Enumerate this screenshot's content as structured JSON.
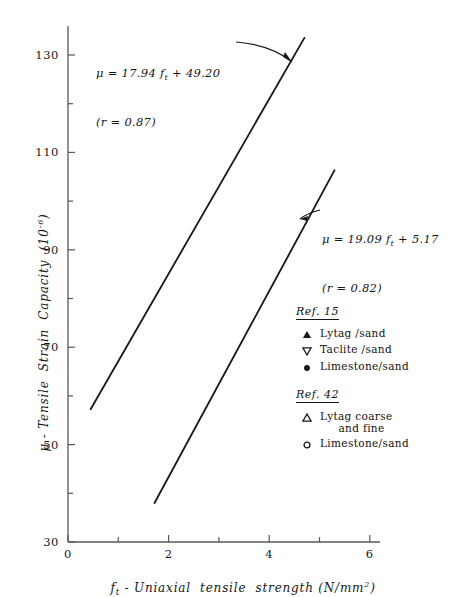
{
  "chart_data": {
    "type": "scatter",
    "title": "",
    "xlabel": "f_t - Uniaxial tensile strength (N/mm^2)",
    "ylabel": "mu - Tensile Strain Capacity (10^-6)",
    "xlim": [
      0,
      6.6
    ],
    "ylim": [
      30,
      136
    ],
    "xticks": [
      0,
      2,
      4,
      6
    ],
    "xticks_minor": [
      1,
      3,
      5
    ],
    "yticks": [
      30,
      50,
      70,
      90,
      110,
      130
    ],
    "yticks_minor": [
      40,
      60,
      80,
      100,
      120
    ],
    "grid": false,
    "legend_position": "right-lower",
    "series": [
      {
        "name": "Lytag/sand",
        "ref": "Ref. 15",
        "marker": "filled-triangle-up",
        "points": [
          [
            3.2,
            114.5
          ],
          [
            3.28,
            116.0
          ],
          [
            3.34,
            115.0
          ],
          [
            3.4,
            113.0
          ],
          [
            3.45,
            112.0
          ],
          [
            3.5,
            110.5
          ],
          [
            3.32,
            108.5
          ],
          [
            3.2,
            104.0
          ],
          [
            3.27,
            103.0
          ],
          [
            3.38,
            102.5
          ],
          [
            3.47,
            101.5
          ],
          [
            3.12,
            99.0
          ],
          [
            3.05,
            96.0
          ],
          [
            2.22,
            84.0
          ],
          [
            2.35,
            84.5
          ]
        ]
      },
      {
        "name": "Taclite/sand",
        "ref": "Ref. 15",
        "marker": "open-triangle-down",
        "points": [
          [
            3.02,
            115.0
          ],
          [
            3.55,
            110.5
          ],
          [
            3.62,
            107.5
          ],
          [
            3.7,
            105.5
          ],
          [
            3.5,
            103.0
          ],
          [
            3.78,
            102.0
          ],
          [
            3.18,
            98.5
          ],
          [
            3.25,
            95.5
          ],
          [
            3.3,
            92.0
          ],
          [
            2.72,
            87.0
          ],
          [
            3.02,
            85.5
          ],
          [
            2.58,
            100.0
          ],
          [
            2.6,
            96.0
          ]
        ]
      },
      {
        "name": "Limestone/sand",
        "ref": "Ref. 15",
        "marker": "filled-circle",
        "points": [
          [
            4.05,
            97.5
          ],
          [
            4.32,
            96.5
          ],
          [
            3.72,
            93.5
          ],
          [
            3.88,
            92.0
          ],
          [
            3.6,
            88.5
          ],
          [
            3.72,
            88.5
          ],
          [
            4.02,
            85.5
          ],
          [
            3.42,
            84.0
          ],
          [
            3.72,
            82.5
          ],
          [
            3.88,
            78.0
          ],
          [
            3.42,
            72.0
          ],
          [
            4.45,
            95.5
          ]
        ]
      },
      {
        "name": "Lytag coarse and fine",
        "ref": "Ref. 42",
        "marker": "open-triangle-up",
        "points": [
          [
            2.7,
            120.0
          ],
          [
            2.85,
            110.0
          ],
          [
            2.4,
            105.5
          ],
          [
            2.02,
            100.5
          ],
          [
            2.72,
            93.0
          ],
          [
            2.92,
            88.5
          ],
          [
            1.28,
            84.5
          ],
          [
            1.48,
            84.0
          ],
          [
            1.88,
            84.0
          ],
          [
            2.22,
            84.0
          ],
          [
            1.62,
            74.5
          ],
          [
            2.02,
            74.5
          ],
          [
            2.28,
            74.5
          ],
          [
            1.22,
            67.5
          ],
          [
            1.68,
            67.5
          ],
          [
            1.92,
            67.5
          ]
        ]
      },
      {
        "name": "Limestone/sand",
        "ref": "Ref. 42",
        "marker": "open-circle",
        "points": [
          [
            3.08,
            80.5
          ],
          [
            3.42,
            70.0
          ],
          [
            3.55,
            62.5
          ],
          [
            2.45,
            58.5
          ],
          [
            2.72,
            55.5
          ],
          [
            2.88,
            55.5
          ],
          [
            3.28,
            55.0
          ],
          [
            4.02,
            55.5
          ],
          [
            2.62,
            52.0
          ],
          [
            2.3,
            49.0
          ],
          [
            2.12,
            46.5
          ],
          [
            1.88,
            42.5
          ],
          [
            3.72,
            59.5
          ]
        ]
      }
    ],
    "fit_lines": [
      {
        "name": "upper-fit-line",
        "equation": "μ = 17.94 f",
        "equation_sub": "t",
        "equation_rest": " + 49.20",
        "r_text": "(r = 0.87)",
        "slope": 17.94,
        "intercept": 49.2,
        "r": 0.87,
        "x_from": 0.45,
        "x_to": 4.7
      },
      {
        "name": "lower-fit-line",
        "equation": "μ = 19.09 f",
        "equation_sub": "t",
        "equation_rest": " + 5.17",
        "r_text": "(r = 0.82)",
        "slope": 19.09,
        "intercept": 5.17,
        "r": 0.82,
        "x_from": 1.72,
        "x_to": 5.3
      }
    ]
  },
  "axes": {
    "x_label_main": "- Uniaxial  tensile  strength (N/mm",
    "x_label_prefix": "f",
    "x_label_prefix_sub": "t",
    "x_label_sup": "2",
    "x_label_suffix": ")",
    "y_label_prefix": "μ",
    "y_label_main": " - Tensile  Strain  Capacity  (10",
    "y_label_sup": "-6",
    "y_label_suffix": ")",
    "x_tick_labels": [
      "0",
      "2",
      "4",
      "6"
    ],
    "y_tick_labels": [
      "130",
      "110",
      "90",
      "70",
      "50",
      "30"
    ]
  },
  "annotations": {
    "eq_upper_line1_a": "μ = 17.94 f",
    "eq_upper_line1_sub": "t",
    "eq_upper_line1_b": " + 49.20",
    "eq_upper_line2": "(r = 0.87)",
    "eq_lower_line1_a": "μ = 19.09 f",
    "eq_lower_line1_sub": "t",
    "eq_lower_line1_b": " + 5.17",
    "eq_lower_line2": "(r = 0.82)"
  },
  "legend": {
    "groups": [
      {
        "heading": "Ref. 15",
        "entries": [
          {
            "symbol": "filled-triangle-up",
            "label": "Lytag /sand"
          },
          {
            "symbol": "open-triangle-down",
            "label": "Taclite /sand"
          },
          {
            "symbol": "filled-circle",
            "label": "Limestone/sand"
          }
        ]
      },
      {
        "heading": "Ref. 42",
        "entries": [
          {
            "symbol": "open-triangle-up",
            "label": "Lytag coarse\n     and fine"
          },
          {
            "symbol": "open-circle",
            "label": "Limestone/sand"
          }
        ]
      }
    ]
  },
  "colors": {
    "ink": "#15171a",
    "axis": "#55585c",
    "background": "#ffffff"
  }
}
